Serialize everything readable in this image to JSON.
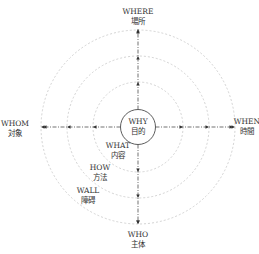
{
  "diagram": {
    "center": {
      "en": "WHY",
      "cn": "目的"
    },
    "axes": {
      "top": {
        "en": "WHERE",
        "cn": "場所"
      },
      "right": {
        "en": "WHEN",
        "cn": "時間"
      },
      "bottom": {
        "en": "WHO",
        "cn": "主体"
      },
      "left": {
        "en": "WHOM",
        "cn": "対象"
      }
    },
    "rings": [
      {
        "en": "WHAT",
        "cn": "内容"
      },
      {
        "en": "HOW",
        "cn": "方法"
      },
      {
        "en": "WALL",
        "cn": "障碍"
      }
    ],
    "colors": {
      "line": "#333333",
      "ring": "#c8c8c8",
      "text": "#333333"
    }
  }
}
